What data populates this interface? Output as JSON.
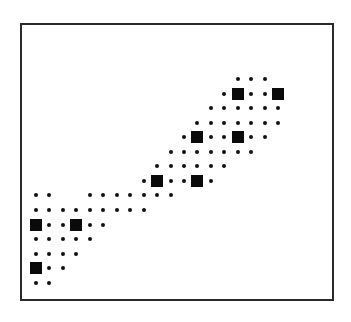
{
  "diagram": {
    "type": "dot-matrix",
    "colors": {
      "frame": "#2a2a2a",
      "dot": "#111111",
      "square": "#0a0a0a",
      "background": "#ffffff"
    },
    "grid": {
      "origin_x": 36,
      "origin_y": 79,
      "col_spacing": 13.45,
      "row_spacing": 14.55
    },
    "rows": [
      {
        "row": 0,
        "dots": [
          15,
          16,
          17
        ],
        "squares": []
      },
      {
        "row": 1,
        "dots": [
          14,
          16,
          17
        ],
        "squares": [
          15,
          18
        ]
      },
      {
        "row": 2,
        "dots": [
          13,
          14,
          15,
          16,
          17,
          18
        ],
        "squares": []
      },
      {
        "row": 3,
        "dots": [
          12,
          13,
          14,
          15,
          16,
          17,
          18
        ],
        "squares": []
      },
      {
        "row": 4,
        "dots": [
          11,
          13,
          14,
          16,
          17
        ],
        "squares": [
          12,
          15
        ]
      },
      {
        "row": 5,
        "dots": [
          10,
          11,
          12,
          13,
          14,
          15,
          16
        ],
        "squares": []
      },
      {
        "row": 6,
        "dots": [
          9,
          10,
          11,
          12,
          13,
          14
        ],
        "squares": []
      },
      {
        "row": 7,
        "dots": [
          8,
          10,
          11,
          13
        ],
        "squares": [
          9,
          12
        ]
      },
      {
        "row": 8,
        "dots": [
          0,
          1,
          4,
          5,
          6,
          7,
          8,
          9,
          10
        ],
        "squares": []
      },
      {
        "row": 9,
        "dots": [
          0,
          1,
          2,
          3,
          4,
          5,
          6,
          7,
          8
        ],
        "squares": []
      },
      {
        "row": 10,
        "dots": [
          1,
          2,
          4,
          5
        ],
        "squares": [
          0,
          3
        ]
      },
      {
        "row": 11,
        "dots": [
          0,
          1,
          2,
          3,
          4
        ],
        "squares": []
      },
      {
        "row": 12,
        "dots": [
          0,
          1,
          2,
          3
        ],
        "squares": []
      },
      {
        "row": 13,
        "dots": [
          1,
          2
        ],
        "squares": [
          0
        ]
      },
      {
        "row": 14,
        "dots": [
          0,
          1
        ],
        "squares": []
      }
    ]
  }
}
